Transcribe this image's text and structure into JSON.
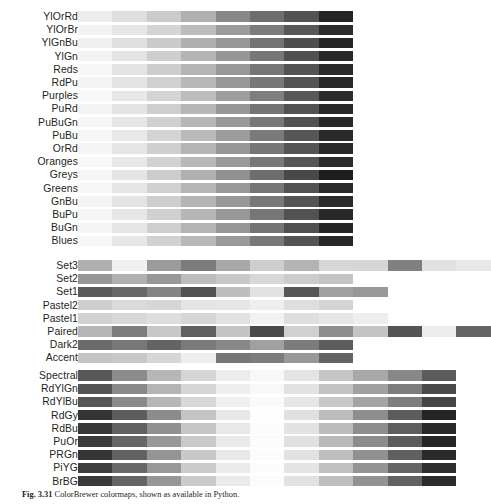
{
  "figure": {
    "title": "ColorBrewer colormaps",
    "caption_label": "Fig. 3.31",
    "caption_text": "ColorBrewer colormaps, shown as available in Python.",
    "background_color": "#ffffff",
    "text_color": "#231f20"
  },
  "chart_data": {
    "type": "heatmap",
    "title": "ColorBrewer colormaps",
    "xlabel": "",
    "ylabel": "",
    "grid": false,
    "legend": "none",
    "groups": [
      {
        "name": "Sequential",
        "rows": [
          {
            "label": "YlOrRd",
            "n": 8,
            "values": [
              236,
              222,
              203,
              176,
              136,
              110,
              83,
              36
            ]
          },
          {
            "label": "YlOrBr",
            "n": 8,
            "values": [
              242,
              230,
              212,
              188,
              155,
              124,
              88,
              44
            ]
          },
          {
            "label": "YlGnBu",
            "n": 8,
            "values": [
              239,
              224,
              202,
              176,
              150,
              116,
              78,
              38
            ]
          },
          {
            "label": "YlGn",
            "n": 8,
            "values": [
              243,
              228,
              206,
              180,
              150,
              118,
              80,
              40
            ]
          },
          {
            "label": "Reds",
            "n": 8,
            "values": [
              246,
              228,
              205,
              180,
              152,
              118,
              83,
              42
            ]
          },
          {
            "label": "RdPu",
            "n": 8,
            "values": [
              244,
              228,
              208,
              184,
              152,
              120,
              84,
              40
            ]
          },
          {
            "label": "Purples",
            "n": 8,
            "values": [
              248,
              232,
              212,
              188,
              158,
              126,
              88,
              44
            ]
          },
          {
            "label": "PuRd",
            "n": 8,
            "values": [
              244,
              228,
              206,
              182,
              150,
              116,
              82,
              40
            ]
          },
          {
            "label": "PuBuGn",
            "n": 8,
            "values": [
              246,
              230,
              208,
              182,
              152,
              120,
              82,
              40
            ]
          },
          {
            "label": "PuBu",
            "n": 8,
            "values": [
              247,
              232,
              212,
              186,
              156,
              122,
              86,
              42
            ]
          },
          {
            "label": "OrRd",
            "n": 8,
            "values": [
              245,
              229,
              207,
              180,
              150,
              118,
              84,
              42
            ]
          },
          {
            "label": "Oranges",
            "n": 8,
            "values": [
              247,
              231,
              210,
              184,
              154,
              120,
              86,
              44
            ]
          },
          {
            "label": "Greys",
            "n": 8,
            "values": [
              246,
              228,
              204,
              176,
              144,
              110,
              72,
              30
            ]
          },
          {
            "label": "Greens",
            "n": 8,
            "values": [
              246,
              230,
              208,
              182,
              152,
              118,
              82,
              40
            ]
          },
          {
            "label": "GnBu",
            "n": 8,
            "values": [
              243,
              228,
              206,
              180,
              152,
              120,
              84,
              42
            ]
          },
          {
            "label": "BuPu",
            "n": 8,
            "values": [
              246,
              230,
              208,
              182,
              152,
              118,
              82,
              40
            ]
          },
          {
            "label": "BuGn",
            "n": 8,
            "values": [
              245,
              229,
              206,
              180,
              150,
              116,
              80,
              38
            ]
          },
          {
            "label": "Blues",
            "n": 8,
            "values": [
              247,
              231,
              210,
              184,
              154,
              120,
              84,
              40
            ]
          }
        ]
      },
      {
        "name": "Qualitative",
        "rows": [
          {
            "label": "Set3",
            "n": 12,
            "values": [
              176,
              240,
              155,
              124,
              168,
              206,
              180,
              215,
              214,
              128,
              226,
              232
            ]
          },
          {
            "label": "Set2",
            "n": 8,
            "values": [
              150,
              176,
              152,
              188,
              200,
              216,
              204,
              196
            ]
          },
          {
            "label": "Set1",
            "n": 9,
            "values": [
              90,
              104,
              132,
              82,
              190,
              226,
              86,
              160,
              152
            ]
          },
          {
            "label": "Pastel2",
            "n": 8,
            "values": [
              206,
              218,
              214,
              228,
              230,
              238,
              222,
              212
            ]
          },
          {
            "label": "Pastel1",
            "n": 9,
            "values": [
              210,
              216,
              222,
              214,
              226,
              242,
              222,
              230,
              238
            ]
          },
          {
            "label": "Paired",
            "n": 12,
            "values": [
              182,
              124,
              200,
              96,
              196,
              74,
              208,
              142,
              196,
              84,
              236,
              100
            ]
          },
          {
            "label": "Dark2",
            "n": 8,
            "values": [
              106,
              120,
              100,
              122,
              136,
              160,
              124,
              92
            ]
          },
          {
            "label": "Accent",
            "n": 8,
            "values": [
              196,
              200,
              214,
              238,
              118,
              124,
              152,
              100
            ]
          }
        ]
      },
      {
        "name": "Diverging",
        "rows": [
          {
            "label": "Spectral",
            "n": 11,
            "values": [
              88,
              140,
              182,
              214,
              236,
              248,
              228,
              198,
              168,
              136,
              92
            ]
          },
          {
            "label": "RdYlGn",
            "n": 11,
            "values": [
              84,
              136,
              180,
              214,
              238,
              248,
              226,
              194,
              160,
              124,
              74
            ]
          },
          {
            "label": "RdYlBu",
            "n": 11,
            "values": [
              86,
              138,
              182,
              216,
              240,
              250,
              230,
              200,
              164,
              126,
              70
            ]
          },
          {
            "label": "RdGy",
            "n": 11,
            "values": [
              52,
              92,
              140,
              196,
              232,
              254,
              224,
              188,
              142,
              92,
              36
            ]
          },
          {
            "label": "RdBu",
            "n": 11,
            "values": [
              56,
              96,
              144,
              198,
              232,
              252,
              226,
              188,
              142,
              94,
              40
            ]
          },
          {
            "label": "PuOr",
            "n": 11,
            "values": [
              60,
              102,
              152,
              202,
              234,
              252,
              224,
              186,
              140,
              92,
              38
            ]
          },
          {
            "label": "PRGn",
            "n": 11,
            "values": [
              54,
              98,
              148,
              200,
              232,
              252,
              226,
              190,
              144,
              96,
              42
            ]
          },
          {
            "label": "PiYG",
            "n": 11,
            "values": [
              62,
              104,
              152,
              204,
              234,
              252,
              228,
              192,
              148,
              100,
              46
            ]
          },
          {
            "label": "BrBG",
            "n": 11,
            "values": [
              58,
              100,
              150,
              202,
              234,
              252,
              226,
              190,
              146,
              98,
              44
            ]
          }
        ]
      }
    ]
  }
}
